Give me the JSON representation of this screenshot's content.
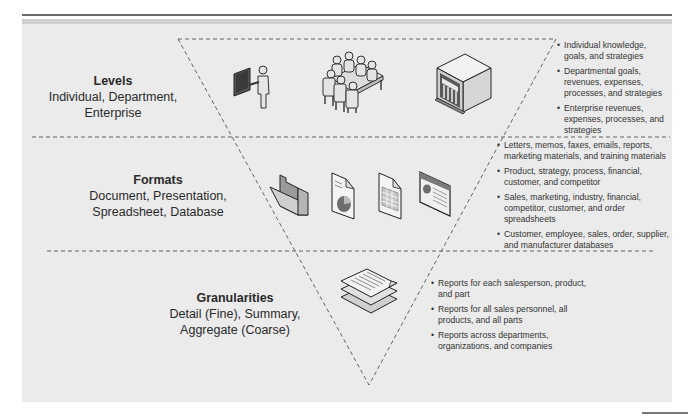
{
  "diagram": {
    "type": "inverted-triangle",
    "rows": [
      {
        "id": "levels",
        "title": "Levels",
        "subtitle": "Individual, Department, Enterprise",
        "icons": [
          "presenter-icon",
          "meeting-table-icon",
          "enterprise-building-icon"
        ],
        "bullets": [
          "Individual knowledge, goals, and strategies",
          "Departmental goals, revenues, expenses, processes, and strategies",
          "Enterprise revenues, expenses, processes, and strategies"
        ]
      },
      {
        "id": "formats",
        "title": "Formats",
        "subtitle": "Document, Presentation, Spreadsheet, Database",
        "icons": [
          "folder-icon",
          "document-chart-icon",
          "spreadsheet-icon",
          "presentation-slide-icon"
        ],
        "bullets": [
          "Letters, memos, faxes, emails, reports, marketing materials, and training materials",
          "Product, strategy, process, financial, customer, and competitor",
          "Sales, marketing, industry, financial, competitor, customer, and order spreadsheets",
          "Customer, employee, sales, order, supplier, and manufacturer databases"
        ]
      },
      {
        "id": "granularities",
        "title": "Granularities",
        "subtitle": "Detail (Fine), Summary, Aggregate (Coarse)",
        "icons": [
          "stacked-reports-icon"
        ],
        "bullets": [
          "Reports for each salesperson, product, and part",
          "Reports for all sales personnel, all products, and all parts",
          "Reports across departments, organizations, and companies"
        ]
      }
    ]
  },
  "colors": {
    "panel_background": "#ebebeb",
    "top_rule": "#6b6b6b",
    "dashed_line": "#555555",
    "text": "#2a2a2a"
  }
}
